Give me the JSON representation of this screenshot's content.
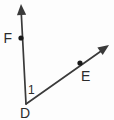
{
  "figure": {
    "type": "angle-diagram",
    "background_color": "#fdfdfd",
    "stroke_color": "#3a3a3a",
    "label_color": "#2b2b2b",
    "point_color": "#1a1a1a"
  },
  "vertex": {
    "name": "D",
    "label": "D",
    "x": 26,
    "y": 104,
    "label_x": 25,
    "label_y": 118
  },
  "angle": {
    "label": "1",
    "label_x": 28,
    "label_y": 94,
    "at_vertex": "D",
    "between_rays": [
      "DF",
      "DE"
    ]
  },
  "rays": [
    {
      "name": "DF",
      "from": "D",
      "through": "F",
      "start_x": 26,
      "start_y": 104,
      "end_x": 21,
      "end_y": 8,
      "arrowhead": true,
      "arrow_tip_x": 21,
      "arrow_tip_y": 4
    },
    {
      "name": "DE",
      "from": "D",
      "through": "E",
      "start_x": 26,
      "start_y": 104,
      "end_x": 104,
      "end_y": 49,
      "arrowhead": true,
      "arrow_tip_x": 109,
      "arrow_tip_y": 45
    }
  ],
  "points": [
    {
      "name": "F",
      "label": "F",
      "x": 21,
      "y": 38,
      "label_x": 12,
      "label_y": 43,
      "label_anchor": "end",
      "radius": 2.6
    },
    {
      "name": "E",
      "label": "E",
      "x": 80,
      "y": 63,
      "label_x": 81,
      "label_y": 81,
      "label_anchor": "start",
      "radius": 2.6
    }
  ]
}
